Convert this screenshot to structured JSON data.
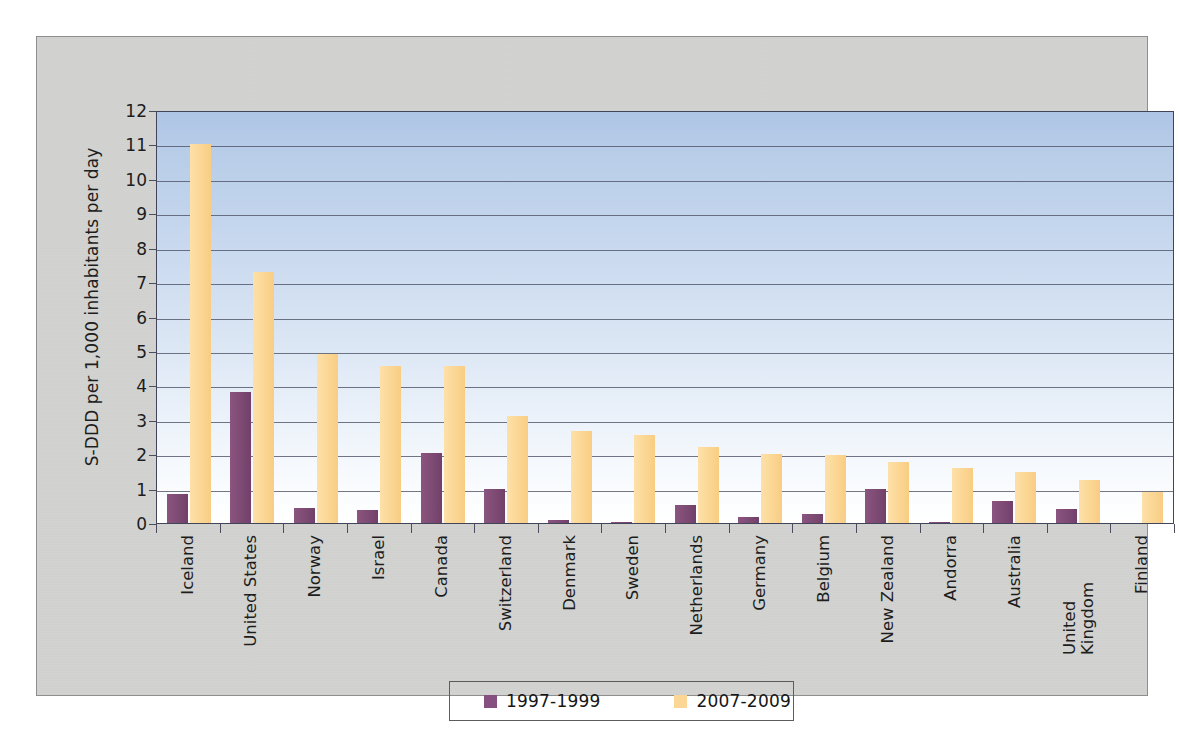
{
  "chart_data": {
    "type": "bar",
    "title": "",
    "subtitle": "",
    "xlabel": "",
    "ylabel": "S-DDD per 1,000 inhabitants per day",
    "ylim": [
      0,
      12
    ],
    "ytick_step": 1,
    "yticks": [
      "0",
      "1",
      "2",
      "3",
      "4",
      "5",
      "6",
      "7",
      "8",
      "9",
      "10",
      "11",
      "12"
    ],
    "grid": true,
    "legend_position": "bottom",
    "categories": [
      "Iceland",
      "United States",
      "Norway",
      "Israel",
      "Canada",
      "Switzerland",
      "Denmark",
      "Sweden",
      "Netherlands",
      "Germany",
      "Belgium",
      "New Zealand",
      "Andorra",
      "Australia",
      "United Kingdom",
      "Finland"
    ],
    "series": [
      {
        "name": "1997-1999",
        "color": "#7d4a73",
        "values": [
          0.85,
          3.8,
          0.45,
          0.38,
          2.02,
          1.0,
          0.1,
          0.03,
          0.52,
          0.18,
          0.25,
          1.0,
          0.03,
          0.65,
          0.4,
          0.0
        ]
      },
      {
        "name": "2007-2009",
        "color": "#fbd694",
        "values": [
          11.0,
          7.3,
          4.9,
          4.55,
          4.55,
          3.12,
          2.68,
          2.55,
          2.22,
          2.0,
          1.98,
          1.76,
          1.6,
          1.48,
          1.25,
          0.9
        ]
      }
    ]
  },
  "legend": {
    "items": [
      {
        "label": "1997-1999",
        "color": "#855080"
      },
      {
        "label": "2007-2009",
        "color": "#fbd694"
      }
    ]
  },
  "colors": {
    "panel_background": "#d2d3d1",
    "plot_gradient_top": "#aec5e5",
    "plot_gradient_bottom": "#ffffff",
    "gridline": "#4b4f63",
    "axis": "#42455a",
    "text": "#1d1d1d"
  }
}
